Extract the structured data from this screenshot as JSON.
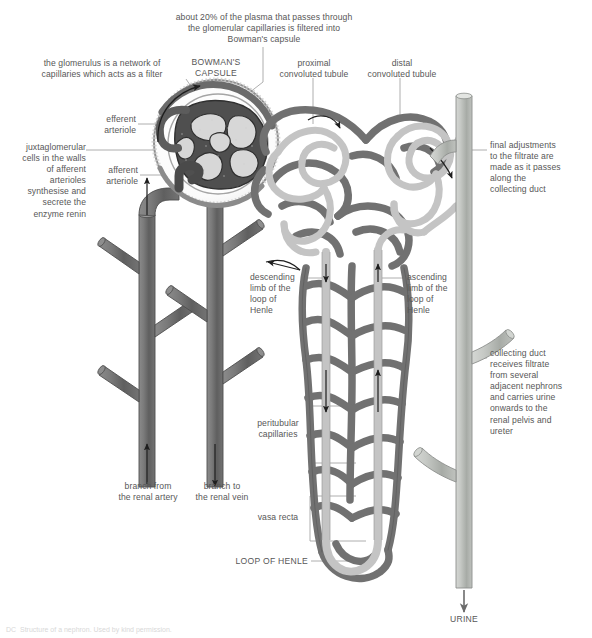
{
  "diagram": {
    "colors": {
      "capillary_dark": "#6e6e6e",
      "capillary_outline": "#4a4a4a",
      "tubule_light": "#c9c9c9",
      "tubule_outline": "#8a8a8a",
      "duct_light": "#b9bcb9",
      "glomerulus_dark": "#4f4f4f",
      "capsule_gray": "#8c8c8c",
      "text": "#575757",
      "leader": "#8e8e8e",
      "background": "#ffffff"
    },
    "labels": {
      "filtration_note": "about 20% of the plasma that passes through\nthe glomerular capillaries is filtered into\nBowman's capsule",
      "glomerulus_note": "the glomerulus is a network of\ncapillaries which acts as a filter",
      "bowmans_capsule": "BOWMAN'S\nCAPSULE",
      "proximal_convoluted_tubule": "proximal\nconvoluted tubule",
      "distal_convoluted_tubule": "distal\nconvoluted tubule",
      "efferent_arteriole": "efferent\narteriole",
      "afferent_arteriole": "afferent\narteriole",
      "juxtaglomerular_note": "juxtaglomerular\ncells in the walls\nof afferent\narterioles\nsynthesise and\nsecrete the\nenzyme renin",
      "collecting_duct_note": "final adjustments\nto the filtrate are\nmade as it passes\nalong the\ncollecting duct",
      "collecting_duct_note2": "collecting duct\nreceives filtrate\nfrom several\nadjacent nephrons\nand carries urine\nonwards to the\nrenal pelvis and\nureter",
      "descending_limb": "descending\nlimb of the\nloop of\nHenle",
      "ascending_limb": "ascending\nlimb of the\nloop of\nHenle",
      "peritubular_capillaries": "peritubular\ncapillaries",
      "vasa_recta": "vasa recta",
      "loop_of_henle": "LOOP OF HENLE",
      "branch_from_renal_artery": "branch from\nthe renal artery",
      "branch_to_renal_vein": "branch to\nthe renal vein",
      "urine": "URINE"
    },
    "footnote": "DC  Structure of a nephron. Used by kind permission."
  }
}
